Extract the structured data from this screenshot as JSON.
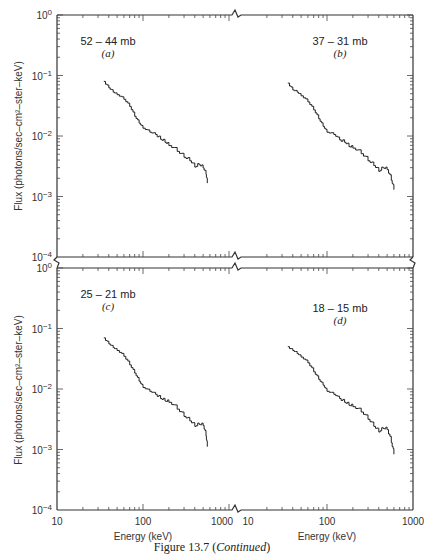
{
  "figure": {
    "caption_prefix": "Figure 13.7 (",
    "caption_italic": "Continued",
    "caption_suffix": ")",
    "top_cut_text": "..."
  },
  "chart_data": [
    {
      "type": "line",
      "panel": "a",
      "title": "52 – 44 mb",
      "letter": "(a)",
      "xlabel": "Energy (keV)",
      "ylabel": "Flux (photons/sec–cm²–ster–keV)",
      "xscale": "log",
      "yscale": "log",
      "xlim": [
        10,
        1000
      ],
      "ylim": [
        0.0001,
        1
      ],
      "x_ticks": [
        "10",
        "100",
        "1000"
      ],
      "y_ticks": [
        "10⁰",
        "10⁻¹",
        "10⁻²",
        "10⁻³",
        "10⁻⁴"
      ],
      "x": [
        35,
        40,
        45,
        50,
        60,
        70,
        80,
        90,
        100,
        120,
        140,
        160,
        180,
        200,
        250,
        300,
        350,
        400,
        450,
        500,
        540,
        560
      ],
      "values": [
        0.08,
        0.065,
        0.055,
        0.05,
        0.042,
        0.032,
        0.022,
        0.017,
        0.014,
        0.012,
        0.011,
        0.0095,
        0.0085,
        0.0075,
        0.006,
        0.0048,
        0.0042,
        0.0033,
        0.0036,
        0.0032,
        0.0025,
        0.0018
      ]
    },
    {
      "type": "line",
      "panel": "b",
      "title": "37 – 31 mb",
      "letter": "(b)",
      "xlabel": "Energy (keV)",
      "ylabel": "Flux (photons/sec–cm²–ster–keV)",
      "xscale": "log",
      "yscale": "log",
      "xlim": [
        10,
        1000
      ],
      "ylim": [
        0.0001,
        1
      ],
      "x_ticks": [
        "10",
        "100",
        "1000"
      ],
      "y_ticks": [
        "10⁰",
        "10⁻¹",
        "10⁻²",
        "10⁻³",
        "10⁻⁴"
      ],
      "x": [
        35,
        40,
        45,
        50,
        60,
        70,
        80,
        90,
        100,
        120,
        140,
        160,
        180,
        200,
        250,
        300,
        350,
        400,
        450,
        500,
        560,
        600
      ],
      "values": [
        0.075,
        0.06,
        0.055,
        0.048,
        0.038,
        0.028,
        0.02,
        0.015,
        0.012,
        0.011,
        0.009,
        0.0085,
        0.0072,
        0.0068,
        0.0055,
        0.0042,
        0.0035,
        0.0028,
        0.0032,
        0.003,
        0.002,
        0.0014
      ]
    },
    {
      "type": "line",
      "panel": "c",
      "title": "25 – 21 mb",
      "letter": "(c)",
      "xlabel": "Energy (keV)",
      "ylabel": "Flux (photons/sec–cm²–ster–keV)",
      "xscale": "log",
      "yscale": "log",
      "xlim": [
        10,
        1000
      ],
      "ylim": [
        0.0001,
        1
      ],
      "x_ticks": [
        "10",
        "100",
        "1000"
      ],
      "y_ticks": [
        "10⁰",
        "10⁻¹",
        "10⁻²",
        "10⁻³",
        "10⁻⁴"
      ],
      "x": [
        35,
        40,
        45,
        50,
        60,
        70,
        80,
        90,
        100,
        120,
        140,
        160,
        180,
        200,
        250,
        300,
        350,
        400,
        450,
        500,
        540,
        560
      ],
      "values": [
        0.07,
        0.058,
        0.05,
        0.045,
        0.036,
        0.026,
        0.019,
        0.014,
        0.011,
        0.0095,
        0.0085,
        0.0075,
        0.0068,
        0.0065,
        0.005,
        0.0038,
        0.0032,
        0.0026,
        0.0028,
        0.0027,
        0.0018,
        0.0012
      ]
    },
    {
      "type": "line",
      "panel": "d",
      "title": "18 – 15 mb",
      "letter": "(d)",
      "xlabel": "Energy (keV)",
      "ylabel": "Flux (photons/sec–cm²–ster–keV)",
      "xscale": "log",
      "yscale": "log",
      "xlim": [
        10,
        1000
      ],
      "ylim": [
        0.0001,
        1
      ],
      "x_ticks": [
        "10",
        "100",
        "1000"
      ],
      "y_ticks": [
        "10⁰",
        "10⁻¹",
        "10⁻²",
        "10⁻³",
        "10⁻⁴"
      ],
      "x": [
        35,
        40,
        45,
        50,
        60,
        70,
        80,
        90,
        100,
        120,
        140,
        160,
        180,
        200,
        250,
        300,
        350,
        400,
        450,
        500,
        560,
        600
      ],
      "values": [
        0.05,
        0.045,
        0.04,
        0.035,
        0.028,
        0.02,
        0.015,
        0.012,
        0.0095,
        0.0085,
        0.0072,
        0.0065,
        0.0058,
        0.0055,
        0.0045,
        0.0034,
        0.0026,
        0.0021,
        0.0024,
        0.0023,
        0.0014,
        0.0009
      ]
    }
  ]
}
